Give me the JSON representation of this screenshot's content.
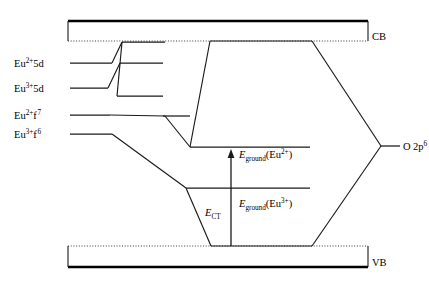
{
  "figure": {
    "type": "energy-level-diagram",
    "title": "",
    "background_color": "#ffffff",
    "line_color": "#1a1a1a"
  },
  "bands": {
    "conduction": {
      "label": "CB",
      "x_left": 68,
      "x_right": 368,
      "y_top": 21,
      "y_bottom": 41,
      "top_style": "solid-thick",
      "bottom_style": "dotted"
    },
    "valence": {
      "label": "VB",
      "x_left": 68,
      "x_right": 368,
      "y_top": 246,
      "y_bottom": 267,
      "top_style": "dotted",
      "bottom_style": "solid-thick"
    }
  },
  "left_levels": [
    {
      "name": "eu2-5d",
      "element": "Eu",
      "charge": "2+",
      "orbital": "5d",
      "label_plain": "Eu2+5d",
      "y": 63,
      "x_start": 70,
      "x_end": 112
    },
    {
      "name": "eu3-5d",
      "element": "Eu",
      "charge": "3+",
      "orbital": "5d",
      "label_plain": "Eu3+5d",
      "y": 88,
      "x_start": 70,
      "x_end": 108
    },
    {
      "name": "eu2-f7",
      "element": "Eu",
      "charge": "2+",
      "orbital": "f",
      "orbital_sup": "7",
      "label_plain": "Eu2+f7",
      "y": 115,
      "x_start": 70,
      "x_end": 110
    },
    {
      "name": "eu3-f6",
      "element": "Eu",
      "charge": "3+",
      "orbital": "f",
      "orbital_sup": "6",
      "label_plain": "Eu3+f6",
      "y": 134,
      "x_start": 70,
      "x_end": 112
    }
  ],
  "center_levels": [
    {
      "name": "upper-5d-shifted",
      "y": 42,
      "x_start": 122,
      "x_end": 165
    },
    {
      "name": "mid-5d-shifted",
      "y": 63,
      "x_start": 120,
      "x_end": 163
    },
    {
      "name": "lower-5d-shifted",
      "y": 96,
      "x_start": 117,
      "x_end": 163
    },
    {
      "name": "eu2-ground-level",
      "y": 147,
      "x_start": 190,
      "x_end": 310
    },
    {
      "name": "eu3-ground-level",
      "y": 188,
      "x_start": 186,
      "x_end": 310
    }
  ],
  "oxygen_level": {
    "label_element": "O",
    "label_orbital": "2p",
    "label_sup": "6",
    "label_plain": "O 2p6",
    "y": 146,
    "x_start": 381,
    "x_end": 400,
    "text_x": 403
  },
  "transitions": [
    {
      "name": "eground-eu2",
      "symbol": "E",
      "subscript": "ground",
      "species": "Eu",
      "species_charge": "2+",
      "label_plain": "Eground(Eu2+)",
      "text_x": 239,
      "text_y": 158
    },
    {
      "name": "eground-eu3",
      "symbol": "E",
      "subscript": "ground",
      "species": "Eu",
      "species_charge": "3+",
      "label_plain": "Eground(Eu3+)",
      "text_x": 239,
      "text_y": 207
    },
    {
      "name": "ect",
      "symbol": "E",
      "subscript": "CT",
      "label_plain": "ECT",
      "text_x": 205,
      "text_y": 216
    }
  ],
  "arrow": {
    "name": "charge-transfer-arrow",
    "x": 231,
    "y_bottom": 246,
    "y_top": 151,
    "direction": "up"
  },
  "hexagon": {
    "name": "oxygen-hexagon",
    "points": "210,41 190,147 186,188 210,246 312,246 381,146 312,41"
  },
  "connectors": [
    {
      "name": "eu2-5d-to-upper",
      "path": "112,63 122,42"
    },
    {
      "name": "eu3-5d-to-mid",
      "path": "108,88 120,63"
    },
    {
      "name": "upper-to-crossdown",
      "path": "122,42 117,96"
    },
    {
      "name": "eu2-f7-to-center",
      "path": "110,115 165,116"
    },
    {
      "name": "eu3-f6-to-down",
      "path": "112,134 190,188"
    },
    {
      "name": "center-f7-to-ground",
      "path": "165,116 190,147"
    },
    {
      "name": "left-hex-upper",
      "path": "210,41 190,147"
    },
    {
      "name": "left-hex-lower",
      "path": "186,188 210,246"
    },
    {
      "name": "top-hex-edge",
      "path": "210,41 312,41"
    },
    {
      "name": "right-hex-upper",
      "path": "312,41 381,146"
    },
    {
      "name": "right-hex-lower",
      "path": "381,146 312,246"
    },
    {
      "name": "bottom-hex-edge",
      "path": "210,246 312,246"
    }
  ]
}
